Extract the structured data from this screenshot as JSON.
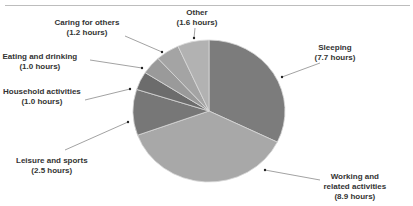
{
  "chart_data": {
    "type": "pie",
    "title": "",
    "unit": "hours",
    "start_angle_deg": 0,
    "direction": "clockwise",
    "categories": [
      "Sleeping",
      "Working and related activities",
      "Leisure and sports",
      "Household activities",
      "Eating and drinking",
      "Caring for others",
      "Other"
    ],
    "values": [
      7.7,
      8.9,
      2.5,
      1.0,
      1.0,
      1.2,
      1.6
    ],
    "colors": [
      "#7c7c7c",
      "#a8a8a8",
      "#777777",
      "#6c6c6c",
      "#9a9a9a",
      "#a4a4a4",
      "#b2b2b2"
    ],
    "labels": [
      {
        "name": "Sleeping",
        "line1": "Sleeping",
        "line2": "(7.7 hours)",
        "x": 335,
        "y": 43,
        "ax": 282,
        "ay": 77,
        "lx": 320,
        "ly": 63
      },
      {
        "name": "Working and related activities",
        "line1": "Working and",
        "line2": "related activities",
        "line3": "(8.9 hours)",
        "x": 355,
        "y": 172,
        "ax": 265,
        "ay": 170,
        "lx": 320,
        "ly": 180
      },
      {
        "name": "Leisure and sports",
        "line1": "Leisure and sports",
        "line2": "(2.5 hours)",
        "x": 52,
        "y": 156,
        "ax": 128,
        "ay": 122,
        "lx": 65,
        "ly": 150
      },
      {
        "name": "Household activities",
        "line1": "Household activities",
        "line2": "(1.0 hours)",
        "x": 42,
        "y": 87,
        "ax": 130,
        "ay": 89,
        "lx": 85,
        "ly": 100
      },
      {
        "name": "Eating and drinking",
        "line1": "Eating and drinking",
        "line2": "(1.0 hours)",
        "x": 40,
        "y": 52,
        "ax": 142,
        "ay": 68,
        "lx": 90,
        "ly": 60
      },
      {
        "name": "Caring for others",
        "line1": "Caring for others",
        "line2": "(1.2 hours)",
        "x": 87,
        "y": 18,
        "ax": 162,
        "ay": 52,
        "lx": 125,
        "ly": 36
      },
      {
        "name": "Other",
        "line1": "Other",
        "line2": "(1.6 hours)",
        "x": 197,
        "y": 8,
        "ax": 194,
        "ay": 38,
        "lx": 195,
        "ly": 28
      }
    ],
    "legend": "none",
    "grid": false
  }
}
